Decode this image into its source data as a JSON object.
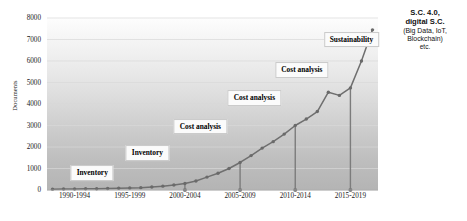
{
  "chart_data": {
    "type": "line",
    "title": "",
    "xlabel": "",
    "ylabel": "Documents",
    "ylim": [
      0,
      8000
    ],
    "ytick_labels": [
      "8000",
      "7000",
      "6000",
      "5000",
      "4000",
      "3000",
      "2000",
      "1000",
      "0"
    ],
    "ytick_values": [
      8000,
      7000,
      6000,
      5000,
      4000,
      3000,
      2000,
      1000,
      0
    ],
    "grid": "horizontal",
    "legend_position": "none",
    "categories": [
      "1990",
      "1991",
      "1992",
      "1993",
      "1994",
      "1995",
      "1996",
      "1997",
      "1998",
      "1999",
      "2000",
      "2001",
      "2002",
      "2003",
      "2004",
      "2005",
      "2006",
      "2007",
      "2008",
      "2009",
      "2010",
      "2011",
      "2012",
      "2013",
      "2014",
      "2015",
      "2016",
      "2017",
      "2018",
      "2019"
    ],
    "values": [
      40,
      45,
      50,
      55,
      60,
      70,
      80,
      95,
      110,
      140,
      180,
      230,
      300,
      420,
      600,
      780,
      1000,
      1280,
      1600,
      1950,
      2250,
      2600,
      3000,
      3300,
      3650,
      4550,
      4400,
      4750,
      6000,
      7450
    ],
    "xtick_labels": [
      "1990-1994",
      "1995-1999",
      "2000-2004",
      "2005-2009",
      "2010-2014",
      "2015-2019"
    ],
    "xtick_positions": [
      2,
      7,
      12,
      17,
      22,
      27
    ],
    "divider_positions": [
      12,
      17,
      22,
      27
    ],
    "line_color": "#6f6f6f",
    "marker_color": "#6a6a6a",
    "divider_color": "#7c7c7c",
    "grid_color": "#d8d8d8",
    "annotations": [
      {
        "text": "Inventory",
        "x_index": 3.6,
        "y_value": 780
      },
      {
        "text": "Inventory",
        "x_index": 8.6,
        "y_value": 1700
      },
      {
        "text": "Cost analysis",
        "x_index": 13.4,
        "y_value": 2950
      },
      {
        "text": "Cost analysis",
        "x_index": 18.3,
        "y_value": 4280
      },
      {
        "text": "Cost analysis",
        "x_index": 22.6,
        "y_value": 5570
      },
      {
        "text": "Sustainability",
        "x_index": 27.1,
        "y_value": 7000
      }
    ]
  },
  "side_note": {
    "line1": "S.C. 4.0,",
    "line2": "digital S.C.",
    "line3": "(Big Data, IoT,",
    "line4": "Blockchain)",
    "line5": "etc."
  }
}
